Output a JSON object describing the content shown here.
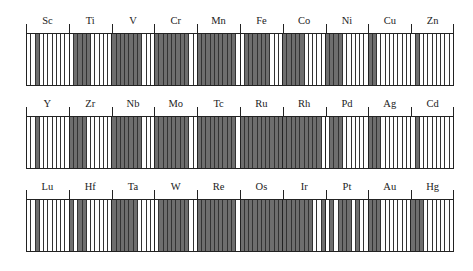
{
  "stripe_colors": {
    "filled": "#6e6e6e",
    "empty": "#ffffff",
    "line": "#222222"
  },
  "rows": [
    {
      "elements": [
        {
          "symbol": "Sc",
          "stripes": [
            0,
            0,
            1,
            0,
            0,
            0,
            0,
            0,
            0,
            0
          ]
        },
        {
          "symbol": "Ti",
          "stripes": [
            0,
            1,
            1,
            1,
            1,
            0,
            0,
            0,
            0,
            0
          ]
        },
        {
          "symbol": "V",
          "stripes": [
            1,
            1,
            1,
            1,
            1,
            1,
            1,
            0,
            0,
            0
          ]
        },
        {
          "symbol": "Cr",
          "stripes": [
            1,
            1,
            1,
            1,
            1,
            1,
            1,
            1,
            0,
            0
          ]
        },
        {
          "symbol": "Mn",
          "stripes": [
            1,
            1,
            1,
            1,
            1,
            1,
            1,
            1,
            1,
            0
          ]
        },
        {
          "symbol": "Fe",
          "stripes": [
            0,
            1,
            1,
            1,
            1,
            1,
            1,
            0,
            0,
            0
          ]
        },
        {
          "symbol": "Co",
          "stripes": [
            1,
            1,
            1,
            1,
            1,
            0,
            0,
            0,
            0,
            0
          ]
        },
        {
          "symbol": "Ni",
          "stripes": [
            1,
            1,
            1,
            1,
            0,
            0,
            0,
            0,
            0,
            0
          ]
        },
        {
          "symbol": "Cu",
          "stripes": [
            1,
            1,
            0,
            0,
            0,
            0,
            0,
            0,
            0,
            0
          ]
        },
        {
          "symbol": "Zn",
          "stripes": [
            0,
            1,
            0,
            0,
            0,
            0,
            0,
            0,
            0,
            0
          ]
        }
      ]
    },
    {
      "elements": [
        {
          "symbol": "Y",
          "stripes": [
            0,
            0,
            1,
            0,
            0,
            0,
            0,
            0,
            0,
            0
          ]
        },
        {
          "symbol": "Zr",
          "stripes": [
            1,
            1,
            1,
            1,
            0,
            0,
            0,
            0,
            0,
            0
          ]
        },
        {
          "symbol": "Nb",
          "stripes": [
            1,
            1,
            1,
            1,
            1,
            1,
            1,
            0,
            0,
            0
          ]
        },
        {
          "symbol": "Mo",
          "stripes": [
            1,
            1,
            1,
            1,
            1,
            1,
            1,
            1,
            0,
            0
          ]
        },
        {
          "symbol": "Tc",
          "stripes": [
            1,
            1,
            1,
            1,
            1,
            1,
            1,
            1,
            1,
            0
          ]
        },
        {
          "symbol": "Ru",
          "stripes": [
            1,
            1,
            1,
            1,
            1,
            1,
            1,
            1,
            1,
            1
          ]
        },
        {
          "symbol": "Rh",
          "stripes": [
            1,
            1,
            1,
            1,
            1,
            1,
            1,
            1,
            1,
            0
          ]
        },
        {
          "symbol": "Pd",
          "stripes": [
            0,
            1,
            1,
            1,
            0,
            0,
            0,
            0,
            0,
            0
          ]
        },
        {
          "symbol": "Ag",
          "stripes": [
            1,
            1,
            1,
            0,
            0,
            0,
            0,
            0,
            0,
            0
          ]
        },
        {
          "symbol": "Cd",
          "stripes": [
            0,
            1,
            0,
            0,
            0,
            0,
            0,
            0,
            0,
            0
          ]
        }
      ]
    },
    {
      "elements": [
        {
          "symbol": "Lu",
          "stripes": [
            0,
            0,
            1,
            0,
            0,
            0,
            0,
            0,
            0,
            0
          ]
        },
        {
          "symbol": "Hf",
          "stripes": [
            1,
            0,
            1,
            1,
            0,
            0,
            0,
            0,
            0,
            0
          ]
        },
        {
          "symbol": "Ta",
          "stripes": [
            1,
            1,
            1,
            1,
            1,
            1,
            0,
            0,
            0,
            0
          ]
        },
        {
          "symbol": "W",
          "stripes": [
            0,
            1,
            1,
            1,
            1,
            1,
            1,
            1,
            0,
            0
          ]
        },
        {
          "symbol": "Re",
          "stripes": [
            1,
            1,
            1,
            1,
            1,
            1,
            1,
            1,
            1,
            0
          ]
        },
        {
          "symbol": "Os",
          "stripes": [
            1,
            1,
            1,
            1,
            1,
            1,
            1,
            1,
            1,
            1
          ]
        },
        {
          "symbol": "Ir",
          "stripes": [
            1,
            1,
            1,
            1,
            1,
            1,
            1,
            0,
            0,
            1
          ]
        },
        {
          "symbol": "Pt",
          "stripes": [
            0,
            1,
            0,
            1,
            1,
            1,
            0,
            1,
            0,
            0
          ]
        },
        {
          "symbol": "Au",
          "stripes": [
            1,
            1,
            1,
            0,
            0,
            0,
            0,
            0,
            0,
            0
          ]
        },
        {
          "symbol": "Hg",
          "stripes": [
            1,
            1,
            1,
            0,
            0,
            0,
            0,
            0,
            0,
            0
          ]
        }
      ]
    }
  ]
}
